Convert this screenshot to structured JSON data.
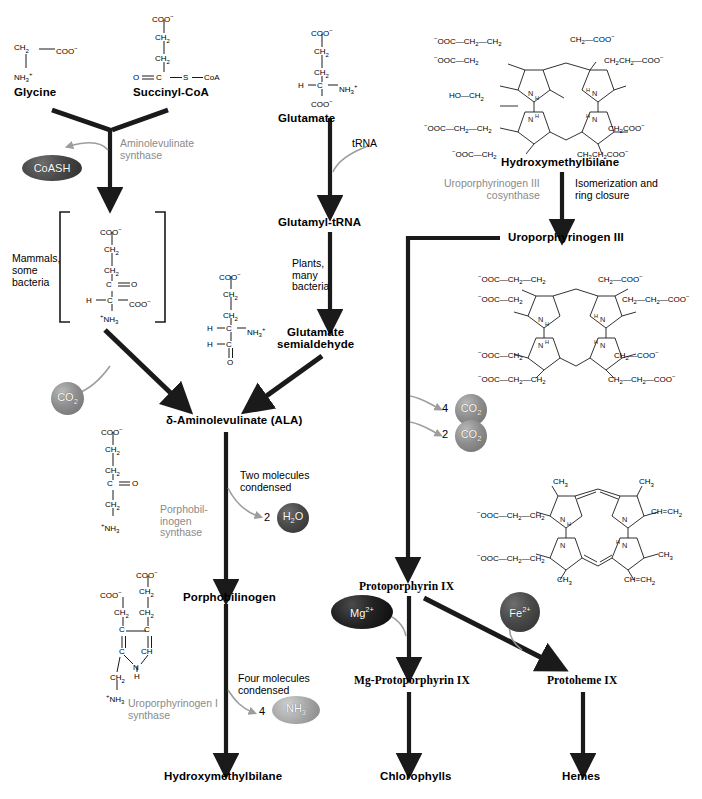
{
  "figure": {
    "accent_color": "#1a1a1a",
    "enzyme_text_color": "#8a8a8a"
  },
  "nodes": {
    "glycine": "Glycine",
    "succinyl_coa": "Succinyl-CoA",
    "glutamate": "Glutamate",
    "glutamyl_trna": "Glutamyl-tRNA",
    "glutamate_semialdehyde_line1": "Glutamate",
    "glutamate_semialdehyde_line2": "semialdehyde",
    "ala_delta": "δ-",
    "ala": "Aminolevulinate (ALA)",
    "porphobilinogen": "Porphobilinogen",
    "hydroxymethylbilane_left": "Hydroxymethylbilane",
    "hydroxymethylbilane_right": "Hydroxymethylbilane",
    "uroporphyrinogen_iii": "Uroporphyrinogen III",
    "protoporphyrin_ix": "Protoporphyrin IX",
    "mg_protoporphyrin_ix": "Mg-Protoporphyrin IX",
    "protoheme_ix": "Protoheme IX",
    "chlorophylls": "Chlorophylls",
    "hemes": "Hemes"
  },
  "enzymes": {
    "aminolevulinate_synthase_l1": "Aminolevulinate",
    "aminolevulinate_synthase_l2": "synthase",
    "porphobilinogen_synthase_l1": "Porphobil-",
    "porphobilinogen_synthase_l2": "inogen",
    "porphobilinogen_synthase_l3": "synthase",
    "uroporphyrinogen_i_synthase_l1": "Uroporphyrinogen I",
    "uroporphyrinogen_i_synthase_l2": "synthase",
    "uroporphyrinogen_iii_cosynthase_l1": "Uroporphyrinogen III",
    "uroporphyrinogen_iii_cosynthase_l2": "cosynthase"
  },
  "annotations": {
    "trna": "tRNA",
    "mammals_l1": "Mammals,",
    "mammals_l2": "some",
    "mammals_l3": "bacteria",
    "plants_l1": "Plants,",
    "plants_l2": "many",
    "plants_l3": "bacteria",
    "two_molecules_l1": "Two molecules",
    "two_molecules_l2": "condensed",
    "four_molecules_l1": "Four molecules",
    "four_molecules_l2": "condensed",
    "isomerization_l1": "Isomerization and",
    "isomerization_l2": "ring closure"
  },
  "byproducts": [
    {
      "name": "coash",
      "coefficient": "",
      "label": "CoASH",
      "shape": "ellipse",
      "tone": "dark"
    },
    {
      "name": "co2-a",
      "coefficient": "",
      "label": "CO2",
      "shape": "circle",
      "tone": "gray"
    },
    {
      "name": "h2o",
      "coefficient": "2",
      "label": "H2O",
      "shape": "circle",
      "tone": "dark"
    },
    {
      "name": "nh3",
      "coefficient": "4",
      "label": "NH3",
      "shape": "ellipse",
      "tone": "lite"
    },
    {
      "name": "co2-4",
      "coefficient": "4",
      "label": "CO2",
      "shape": "circle",
      "tone": "gray"
    },
    {
      "name": "co2-2",
      "coefficient": "2",
      "label": "CO2",
      "shape": "circle",
      "tone": "gray"
    }
  ],
  "cofactors": [
    {
      "name": "mg",
      "label": "Mg",
      "charge": "2+",
      "tone": "black"
    },
    {
      "name": "fe",
      "label": "Fe",
      "charge": "2+",
      "tone": "dark"
    }
  ],
  "chem_text": {
    "coo_minus": "COO−",
    "ooc_minus": "−OOC",
    "ch2": "CH2",
    "ch3": "CH3",
    "nh3_plus": "NH3+",
    "coa": "CoA",
    "ho": "HO",
    "nh": "NH",
    "n": "N",
    "h": "H",
    "c": "C",
    "s": "S",
    "o": "O",
    "ch": "CH"
  },
  "structures": {
    "glycine": [
      "CH2",
      "COO−",
      "NH3+"
    ],
    "succinyl_coa": [
      "COO−",
      "CH2",
      "CH2",
      "O=C—S—CoA"
    ],
    "glutamate": [
      "COO−",
      "CH2",
      "CH2",
      "H—C—NH3+",
      "COO−"
    ],
    "bracketed_intermediate": [
      "COO−",
      "CH2",
      "CH2",
      "C=O",
      "H—C—COO−",
      "+NH3"
    ],
    "glutamate_semialdehyde": [
      "COO−",
      "CH2",
      "CH2",
      "H—C—NH3+",
      "H—C",
      "O"
    ],
    "ala": [
      "COO−",
      "CH2",
      "CH2",
      "C=O",
      "CH2",
      "+NH3"
    ],
    "porphobilinogen": [
      "COO−",
      "CH2",
      "COO−",
      "CH2",
      "CH2",
      "C",
      "C",
      "CH",
      "NH",
      "CH2",
      "+NH3"
    ],
    "hydroxymethylbilane_substituents": [
      "−OOC—CH2—CH2",
      "−OOC—CH2",
      "HO—CH2",
      "CH2—COO−",
      "CH2CH2—COO−",
      "−OOC—CH2—CH2",
      "−OOC—CH2",
      "CH2COO−",
      "CH2CH2COO−"
    ],
    "uroporphyrinogen_iii_substituents": [
      "−OOC—CH2—CH2",
      "−OOC—CH2",
      "CH2—COO−",
      "CH2—CH2—COO−",
      "−OOC—CH2",
      "−OOC—CH2—CH2",
      "CH2—COO−",
      "CH2—CH2—COO−"
    ],
    "protoporphyrin_ix_substituents": [
      "CH3",
      "CH3",
      "−OOC—CH2—CH2",
      "CH=CH2",
      "−OOC—CH2—CH2",
      "CH3",
      "CH3",
      "CH=CH2"
    ]
  }
}
